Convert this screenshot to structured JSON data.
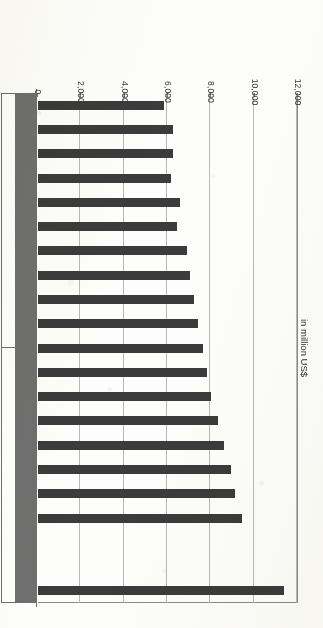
{
  "chart_data": {
    "type": "bar",
    "orientation": "horizontal",
    "title": "",
    "xlabel": "in million US$",
    "ylabel": "",
    "xlim": [
      0,
      12000
    ],
    "xticks": [
      "0",
      "2,000",
      "4,000",
      "6,000",
      "8,000",
      "10,000",
      "12,000"
    ],
    "xtick_values": [
      0,
      2000,
      4000,
      6000,
      8000,
      10000,
      12000
    ],
    "grid": true,
    "legend": false,
    "series_label": "Global revenue",
    "categories": [
      "1994",
      "1995",
      "1996",
      "1997",
      "1998",
      "1999",
      "2000",
      "2001",
      "2002",
      "2003",
      "2004",
      "2005",
      "2006",
      "2007",
      "2008",
      "2009",
      "2010",
      "2011",
      "2012",
      "2013",
      "2014"
    ],
    "values": [
      5838,
      6209,
      6225,
      6157,
      6544,
      6429,
      6880,
      7000,
      7200,
      7400,
      7600,
      7800,
      8000,
      8300,
      8600,
      8900,
      9100,
      9400,
      0,
      0,
      11339
    ],
    "value_labels": [
      "5,838",
      "6,209",
      "6,225",
      "6,157",
      "6,544",
      "6,429",
      "6,880",
      "7,000",
      "7,200",
      "7,400",
      "7,600",
      "7,800",
      "8,000",
      "8,300",
      "8,600",
      "8,900",
      "9,100",
      "9,400",
      "0",
      "0",
      "11,339"
    ],
    "bar_color": "#3b3b3b",
    "gridline_color": "#b9b9b9"
  },
  "axis": {
    "title": "in million US$",
    "ticks": [
      "0",
      "2,000",
      "4,000",
      "6,000",
      "8,000",
      "10,000",
      "12,000"
    ]
  },
  "table": {
    "row_header": "Global revenue",
    "years": [
      "1994",
      "1995",
      "1996",
      "1997",
      "1998",
      "1999",
      "2000",
      "2001",
      "2002",
      "2003",
      "2004",
      "2005",
      "2006",
      "2007",
      "2008",
      "2009",
      "2010",
      "2011",
      "2012",
      "2013",
      "2014"
    ],
    "values": [
      "5,838",
      "6,209",
      "6,225",
      "6,157",
      "6,544",
      "6,429",
      "6,880",
      "7,000",
      "7,200",
      "7,400",
      "7,600",
      "7,800",
      "8,000",
      "8,300",
      "8,600",
      "8,900",
      "9,100",
      "9,400",
      "0",
      "0",
      "11,339"
    ]
  }
}
